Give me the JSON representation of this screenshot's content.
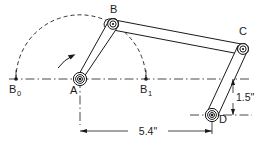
{
  "diagram": {
    "canvas": {
      "width": 261,
      "height": 144
    },
    "stroke_color": "#1a1a1a",
    "background_color": "#ffffff"
  },
  "labels": {
    "b_zero": "B",
    "b_zero_sub": "0",
    "a": "A",
    "b": "B",
    "b_one": "B",
    "b_one_sub": "1",
    "c": "C",
    "d": "D"
  },
  "dimensions": {
    "horizontal": "5.4\"",
    "vertical": "1.5\""
  },
  "points": {
    "B0": {
      "x": 16,
      "y": 79
    },
    "A": {
      "x": 80,
      "y": 79
    },
    "B": {
      "x": 113,
      "y": 24
    },
    "B1": {
      "x": 146,
      "y": 79
    },
    "C": {
      "x": 243,
      "y": 49
    },
    "D": {
      "x": 212,
      "y": 115
    }
  },
  "geometry": {
    "crank_radius": 64,
    "ground_y": 79,
    "d_level_y": 115,
    "dim_line_y": 131,
    "dim_vert_x": 233
  },
  "icons": {
    "rotation_arrow": "curved-arrow-ccw-icon",
    "pivot_ground": "ground-pivot-icon",
    "pivot_joint": "pin-joint-icon"
  }
}
